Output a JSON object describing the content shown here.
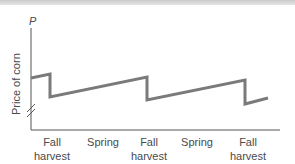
{
  "chart_data": {
    "type": "line",
    "title": "",
    "xlabel": "",
    "ylabel": "Price of corn",
    "y_axis_symbol": "P",
    "categories": [
      "Fall harvest",
      "Spring",
      "Fall harvest",
      "Spring",
      "Fall harvest"
    ],
    "tick_labels": [
      {
        "line1": "Fall",
        "line2": "harvest"
      },
      {
        "line1": "Spring",
        "line2": ""
      },
      {
        "line1": "Fall",
        "line2": "harvest"
      },
      {
        "line1": "Spring",
        "line2": ""
      },
      {
        "line1": "Fall",
        "line2": "harvest"
      }
    ],
    "series": [
      {
        "name": "Price of corn",
        "description": "Sawtooth: price rises steadily between harvests, drops sharply at each fall harvest",
        "points_px": [
          [
            31,
            78
          ],
          [
            50,
            74
          ],
          [
            50,
            97
          ],
          [
            147,
            77
          ],
          [
            147,
            100
          ],
          [
            245,
            80
          ],
          [
            245,
            104
          ],
          [
            268,
            98
          ]
        ]
      }
    ],
    "axis_break": true,
    "grid": false,
    "legend": "none",
    "line_color": "#7a7a7a"
  }
}
